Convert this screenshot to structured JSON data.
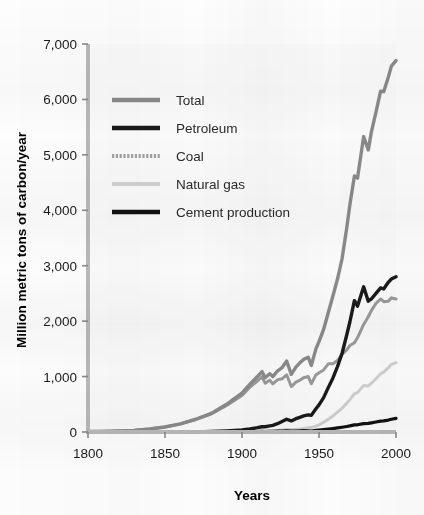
{
  "chart_data": {
    "type": "line",
    "title": "",
    "xlabel": "Years",
    "ylabel": "Million metric tons of carbon/year",
    "xlim": [
      1800,
      2000
    ],
    "ylim": [
      0,
      7000
    ],
    "grid": false,
    "legend_position": "upper-left-inside",
    "xticks": [
      "1800",
      "1850",
      "1900",
      "1950",
      "2000"
    ],
    "xtick_values": [
      1800,
      1850,
      1900,
      1950,
      2000
    ],
    "yticks": [
      "0",
      "1,000",
      "2,000",
      "3,000",
      "4,000",
      "5,000",
      "6,000",
      "7,000"
    ],
    "ytick_values": [
      0,
      1000,
      2000,
      3000,
      4000,
      5000,
      6000,
      7000
    ],
    "x": [
      1800,
      1810,
      1820,
      1830,
      1840,
      1850,
      1860,
      1870,
      1880,
      1890,
      1895,
      1900,
      1905,
      1910,
      1913,
      1915,
      1918,
      1920,
      1923,
      1926,
      1929,
      1932,
      1935,
      1938,
      1940,
      1943,
      1945,
      1948,
      1950,
      1953,
      1956,
      1959,
      1962,
      1965,
      1968,
      1970,
      1973,
      1975,
      1979,
      1982,
      1984,
      1987,
      1990,
      1992,
      1995,
      1997,
      2000
    ],
    "series": [
      {
        "name": "Total",
        "color": "#8a8a8a",
        "style": "solid",
        "values": [
          8,
          12,
          18,
          30,
          54,
          90,
          148,
          230,
          335,
          500,
          600,
          700,
          860,
          1000,
          1090,
          980,
          1050,
          1000,
          1100,
          1160,
          1280,
          1040,
          1170,
          1260,
          1310,
          1350,
          1200,
          1500,
          1630,
          1850,
          2150,
          2450,
          2760,
          3130,
          3680,
          4090,
          4620,
          4580,
          5330,
          5090,
          5410,
          5770,
          6150,
          6140,
          6400,
          6600,
          6700
        ]
      },
      {
        "name": "Petroleum",
        "color": "#1a1a1a",
        "style": "solid",
        "values": [
          0,
          0,
          0,
          0,
          0,
          0,
          0,
          2,
          8,
          20,
          28,
          37,
          55,
          78,
          95,
          95,
          110,
          120,
          150,
          190,
          230,
          200,
          240,
          270,
          290,
          310,
          300,
          420,
          490,
          620,
          800,
          970,
          1180,
          1420,
          1750,
          1980,
          2370,
          2270,
          2620,
          2360,
          2400,
          2500,
          2600,
          2580,
          2700,
          2760,
          2800
        ]
      },
      {
        "name": "Coal",
        "color": "#9a9a9a",
        "style": "solid",
        "values": [
          8,
          12,
          18,
          30,
          54,
          90,
          147,
          226,
          325,
          478,
          570,
          660,
          805,
          920,
          995,
          880,
          935,
          870,
          940,
          960,
          1030,
          820,
          900,
          940,
          980,
          1000,
          870,
          1030,
          1070,
          1120,
          1230,
          1230,
          1290,
          1400,
          1480,
          1560,
          1610,
          1700,
          1940,
          2080,
          2190,
          2320,
          2400,
          2350,
          2360,
          2420,
          2400
        ]
      },
      {
        "name": "Natural gas",
        "color": "#cfcfcf",
        "style": "solid",
        "values": [
          0,
          0,
          0,
          0,
          0,
          0,
          0,
          0,
          1,
          2,
          3,
          5,
          8,
          12,
          16,
          17,
          20,
          22,
          28,
          36,
          45,
          40,
          47,
          55,
          62,
          75,
          80,
          105,
          130,
          175,
          230,
          290,
          360,
          430,
          520,
          580,
          690,
          710,
          840,
          830,
          880,
          960,
          1050,
          1080,
          1160,
          1220,
          1250
        ]
      },
      {
        "name": "Cement production",
        "color": "#111111",
        "style": "solid",
        "values": [
          0,
          0,
          0,
          0,
          0,
          0,
          0,
          0,
          1,
          2,
          3,
          4,
          6,
          8,
          10,
          9,
          10,
          11,
          14,
          17,
          20,
          15,
          18,
          22,
          24,
          22,
          18,
          28,
          33,
          42,
          52,
          62,
          74,
          86,
          100,
          110,
          128,
          130,
          152,
          155,
          165,
          180,
          196,
          200,
          215,
          230,
          245
        ]
      }
    ],
    "legend": [
      {
        "label": "Total",
        "color": "#8a8a8a",
        "swatch": "thick-solid"
      },
      {
        "label": "Petroleum",
        "color": "#1a1a1a",
        "swatch": "thick-solid"
      },
      {
        "label": "Coal",
        "color": "#a2a2a2",
        "swatch": "thick-dotted"
      },
      {
        "label": "Natural gas",
        "color": "#d2d2d2",
        "swatch": "thick-solid"
      },
      {
        "label": "Cement production",
        "color": "#111111",
        "swatch": "thick-solid"
      }
    ]
  }
}
